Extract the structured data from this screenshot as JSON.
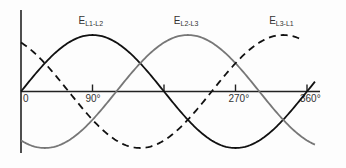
{
  "chart_data": {
    "type": "line",
    "title": "",
    "xlabel": "",
    "ylabel": "",
    "x_unit": "degrees",
    "xlim": [
      0,
      370
    ],
    "ylim": [
      -1.05,
      1.05
    ],
    "ticks": [
      {
        "value": 0,
        "label": "0"
      },
      {
        "value": 90,
        "label": "90°"
      },
      {
        "value": 180,
        "label": ""
      },
      {
        "value": 270,
        "label": "270°"
      },
      {
        "value": 360,
        "label": "360°"
      }
    ],
    "series": [
      {
        "name": "E_L1-L2",
        "label_main": "E",
        "label_sub": "L1-L2",
        "phase_deg": 0,
        "x_end": 370,
        "style": "solid",
        "color": "#111111",
        "label_at": 90
      },
      {
        "name": "E_L2-L3",
        "label_main": "E",
        "label_sub": "L2-L3",
        "phase_deg": 120,
        "x_end": 370,
        "style": "solid",
        "color": "#777777",
        "label_at": 210
      },
      {
        "name": "E_L3-L1",
        "label_main": "E",
        "label_sub": "L3-L1",
        "phase_deg": 240,
        "x_end": 350,
        "style": "dashed",
        "color": "#111111",
        "label_at": 330
      }
    ]
  }
}
